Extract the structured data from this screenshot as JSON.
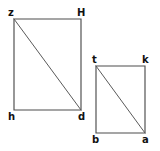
{
  "figure": {
    "background_color": "#ffffff",
    "stroke_color": "#4d4d4d",
    "diagonal_color": "#5a5a5a",
    "label_color": "#111111",
    "shapes": [
      {
        "name": "left-rectangle",
        "type": "rectangle-with-diagonal",
        "vertices": {
          "top_left": {
            "label": "z",
            "x": 14,
            "y": 19
          },
          "top_right": {
            "label": "H",
            "x": 81,
            "y": 19
          },
          "bottom_left": {
            "label": "h",
            "x": 14,
            "y": 110
          },
          "bottom_right": {
            "label": "d",
            "x": 81,
            "y": 110
          }
        },
        "diagonal": {
          "from": "z",
          "to": "d"
        }
      },
      {
        "name": "right-rectangle",
        "type": "rectangle-with-diagonal",
        "vertices": {
          "top_left": {
            "label": "t",
            "x": 96,
            "y": 66
          },
          "top_right": {
            "label": "k",
            "x": 145,
            "y": 66
          },
          "bottom_left": {
            "label": "b",
            "x": 96,
            "y": 133
          },
          "bottom_right": {
            "label": "a",
            "x": 145,
            "y": 133
          }
        },
        "diagonal": {
          "from": "t",
          "to": "a"
        }
      }
    ],
    "labels": {
      "z": "z",
      "H": "H",
      "h": "h",
      "d": "d",
      "t": "t",
      "k": "k",
      "b": "b",
      "a": "a"
    }
  }
}
